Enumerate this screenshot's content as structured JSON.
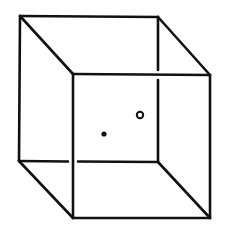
{
  "diagram": {
    "type": "necker-cube",
    "colors": {
      "line": "#111111",
      "background": "#ffffff"
    },
    "vertices": {
      "back_top_left": [
        20,
        16
      ],
      "back_top_right": [
        158,
        17
      ],
      "back_bottom_left": [
        19,
        161
      ],
      "back_bottom_right": [
        158,
        162
      ],
      "front_top_left": [
        73,
        74
      ],
      "front_top_right": [
        210,
        75
      ],
      "front_bottom_left": [
        73,
        218
      ],
      "front_bottom_right": [
        210,
        218
      ]
    },
    "markers": [
      {
        "name": "filled-dot",
        "center": [
          104,
          134
        ],
        "radius": 2.6,
        "style": "filled"
      },
      {
        "name": "hollow-circle",
        "center": [
          140,
          115
        ],
        "radius": 3.2,
        "style": "hollow"
      }
    ],
    "line_breaks": [
      "back bottom edge interrupted where it crosses the front left edge",
      "back right edge interrupted where it crosses the front top edge"
    ]
  }
}
